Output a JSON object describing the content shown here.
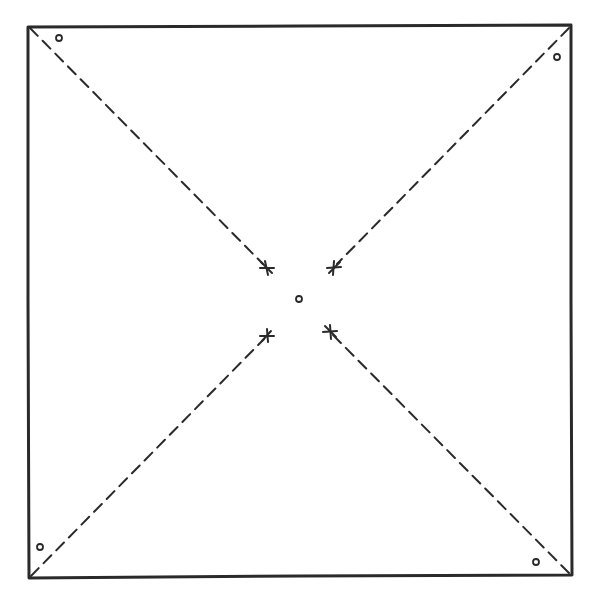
{
  "diagram": {
    "type": "pinwheel-template",
    "colors": {
      "background": "#ffffff",
      "stroke": "#2a2a2a"
    },
    "square": {
      "corners": [
        [
          28,
          26
        ],
        [
          571,
          25
        ],
        [
          571,
          575
        ],
        [
          29,
          578
        ]
      ]
    },
    "cut_lines": [
      {
        "from": [
          29,
          27
        ],
        "to": [
          267,
          268
        ],
        "end_mark": "star"
      },
      {
        "from": [
          570,
          26
        ],
        "to": [
          334,
          268
        ],
        "end_mark": "star"
      },
      {
        "from": [
          30,
          577
        ],
        "to": [
          267,
          335
        ],
        "end_mark": "star"
      },
      {
        "from": [
          570,
          574
        ],
        "to": [
          330,
          331
        ],
        "end_mark": "star"
      }
    ],
    "holes": [
      {
        "name": "top-left",
        "cx": 59,
        "cy": 38
      },
      {
        "name": "top-right",
        "cx": 557,
        "cy": 57
      },
      {
        "name": "bottom-left",
        "cx": 40,
        "cy": 547
      },
      {
        "name": "bottom-right",
        "cx": 536,
        "cy": 562
      },
      {
        "name": "center",
        "cx": 299,
        "cy": 299
      }
    ]
  }
}
